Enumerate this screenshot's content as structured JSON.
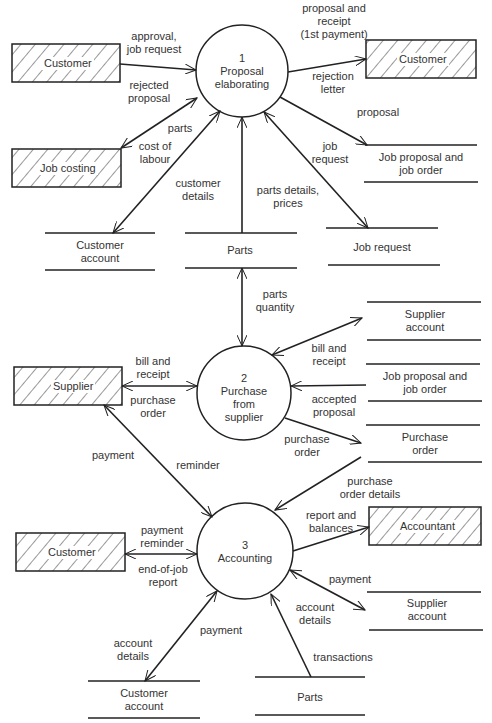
{
  "diagram": {
    "type": "data-flow-diagram",
    "processes": [
      {
        "id": "p1",
        "number": "1",
        "name": "Proposal\nelaborating"
      },
      {
        "id": "p2",
        "number": "2",
        "name": "Purchase\nfrom\nsupplier"
      },
      {
        "id": "p3",
        "number": "3",
        "name": "Accounting"
      }
    ],
    "entities": [
      {
        "id": "e_customer_1",
        "label": "Customer"
      },
      {
        "id": "e_customer_2",
        "label": "Customer"
      },
      {
        "id": "e_job_costing",
        "label": "Job costing"
      },
      {
        "id": "e_supplier",
        "label": "Supplier"
      },
      {
        "id": "e_customer_3",
        "label": "Customer"
      },
      {
        "id": "e_accountant",
        "label": "Accountant"
      }
    ],
    "stores": [
      {
        "id": "s_customer_account_1",
        "label": "Customer\naccount"
      },
      {
        "id": "s_parts_1",
        "label": "Parts"
      },
      {
        "id": "s_job_request",
        "label": "Job request"
      },
      {
        "id": "s_job_proposal_1",
        "label": "Job proposal and\njob order"
      },
      {
        "id": "s_supplier_account_1",
        "label": "Supplier\naccount"
      },
      {
        "id": "s_job_proposal_2",
        "label": "Job proposal and\njob order"
      },
      {
        "id": "s_purchase_order",
        "label": "Purchase\norder"
      },
      {
        "id": "s_supplier_account_2",
        "label": "Supplier\naccount"
      },
      {
        "id": "s_customer_account_2",
        "label": "Customer\naccount"
      },
      {
        "id": "s_parts_2",
        "label": "Parts"
      }
    ],
    "flows": {
      "approval_job_request": "approval,\njob request",
      "rejected_proposal": "rejected\nproposal",
      "proposal_receipt": "proposal and\nreceipt\n(1st payment)",
      "rejection_letter": "rejection\nletter",
      "proposal": "proposal",
      "parts": "parts",
      "cost_of_labour": "cost of\nlabour",
      "customer_details": "customer\ndetails",
      "parts_details_prices": "parts details,\nprices",
      "job_request": "job\nrequest",
      "parts_quantity": "parts\nquantity",
      "bill_receipt_supplier": "bill and\nreceipt",
      "purchase_order_supplier": "purchase\norder",
      "bill_receipt_account": "bill and\nreceipt",
      "accepted_proposal": "accepted\nproposal",
      "purchase_order_store": "purchase\norder",
      "payment_supplier": "payment",
      "reminder": "reminder",
      "purchase_order_details": "purchase\norder details",
      "payment_reminder": "payment\nreminder",
      "end_of_job_report": "end-of-job\nreport",
      "report_balances": "report and\nbalances",
      "payment_supplier_account": "payment",
      "account_details_supplier": "account\ndetails",
      "account_details_customer": "account\ndetails",
      "payment_customer": "payment",
      "transactions": "transactions"
    }
  }
}
